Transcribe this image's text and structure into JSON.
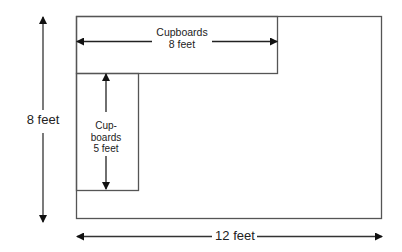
{
  "diagram": {
    "room": {
      "width_label": "12 feet",
      "height_label": "8 feet"
    },
    "top_cupboards": {
      "line1": "Cupboards",
      "line2": "8 feet"
    },
    "side_cupboards": {
      "line1": "Cup-",
      "line2": "boards",
      "line3": "5 feet"
    },
    "colors": {
      "line": "#555555",
      "arrow": "#111111",
      "background": "#ffffff"
    }
  }
}
